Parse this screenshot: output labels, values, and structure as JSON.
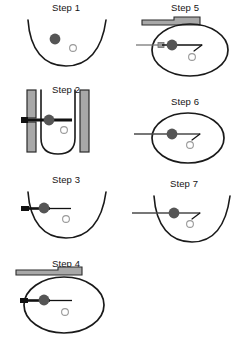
{
  "figure": {
    "background_color": "#ffffff",
    "stroke_color": "#1a1a1a",
    "filled_marker_color": "#555555",
    "hollow_marker_color": "#ffffff",
    "hollow_marker_stroke": "#9a9a9a",
    "bar_fill_color": "#a8a8a8",
    "bar_stroke_color": "#2b2b2b",
    "arrow_color": "#111111",
    "thin_line_color": "#6e6e6e"
  },
  "panels": [
    {
      "id": "step-1",
      "label": "Step 1",
      "column": "left",
      "shape": "open-well",
      "elements": [
        "well-curve",
        "filled-particle",
        "hollow-particle"
      ],
      "has_arrow": false,
      "has_bars": false,
      "has_hook": false
    },
    {
      "id": "step-2",
      "label": "Step 2",
      "column": "left",
      "shape": "deep-u-well",
      "elements": [
        "left-bar-upper",
        "left-bar-lower",
        "right-bar",
        "deep-u-curve",
        "thick-arrow",
        "filled-particle",
        "hollow-particle"
      ],
      "has_arrow": true,
      "arrow_style": "thick",
      "has_bars": true,
      "has_hook": false
    },
    {
      "id": "step-3",
      "label": "Step 3",
      "column": "left",
      "shape": "open-well",
      "elements": [
        "well-curve",
        "medium-arrow",
        "filled-particle",
        "hollow-particle"
      ],
      "has_arrow": true,
      "arrow_style": "medium",
      "has_bars": false,
      "has_hook": false
    },
    {
      "id": "step-4",
      "label": "Step 4",
      "column": "left",
      "shape": "ellipse",
      "elements": [
        "stepped-bar",
        "ellipse",
        "medium-arrow",
        "filled-particle",
        "hollow-particle"
      ],
      "has_arrow": true,
      "arrow_style": "medium",
      "has_bars": true,
      "has_hook": false
    },
    {
      "id": "step-5",
      "label": "Step 5",
      "column": "right",
      "shape": "ellipse",
      "elements": [
        "stepped-bar",
        "ellipse",
        "thin-arrow",
        "filled-particle",
        "hook-connector",
        "hollow-particle"
      ],
      "has_arrow": true,
      "arrow_style": "thin",
      "has_bars": true,
      "has_hook": true
    },
    {
      "id": "step-6",
      "label": "Step 6",
      "column": "right",
      "shape": "ellipse",
      "elements": [
        "ellipse",
        "thin-line",
        "filled-particle",
        "hook-connector",
        "hollow-particle"
      ],
      "has_arrow": false,
      "has_bars": false,
      "has_hook": true
    },
    {
      "id": "step-7",
      "label": "Step 7",
      "column": "right",
      "shape": "open-well",
      "elements": [
        "well-curve",
        "thin-line",
        "filled-particle",
        "hook-connector",
        "hollow-particle"
      ],
      "has_arrow": false,
      "has_bars": false,
      "has_hook": true
    }
  ]
}
